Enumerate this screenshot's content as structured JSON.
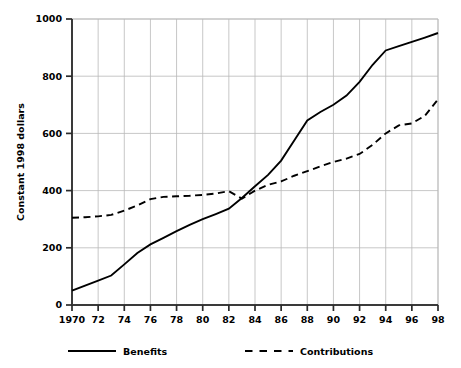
{
  "chart_data": {
    "type": "line",
    "title": "",
    "xlabel": "",
    "ylabel": "Constant 1998 dollars",
    "xlim": [
      1970,
      1998
    ],
    "ylim": [
      0,
      1000
    ],
    "grid": true,
    "legend_position": "bottom",
    "x": [
      1970,
      1971,
      1972,
      1973,
      1974,
      1975,
      1976,
      1977,
      1978,
      1979,
      1980,
      1981,
      1982,
      1983,
      1984,
      1985,
      1986,
      1987,
      1988,
      1989,
      1990,
      1991,
      1992,
      1993,
      1994,
      1995,
      1996,
      1997,
      1998
    ],
    "x_tick_labels": [
      "1970",
      "72",
      "74",
      "76",
      "78",
      "80",
      "82",
      "84",
      "86",
      "88",
      "90",
      "92",
      "94",
      "96",
      "98"
    ],
    "y_tick_labels": [
      "0",
      "200",
      "400",
      "600",
      "800",
      "1000"
    ],
    "y_ticks": [
      0,
      200,
      400,
      600,
      800,
      1000
    ],
    "series": [
      {
        "name": "Benefits",
        "style": "solid",
        "color": "#000000",
        "values": [
          50,
          68,
          85,
          103,
          142,
          182,
          212,
          235,
          258,
          280,
          300,
          318,
          337,
          374,
          415,
          455,
          505,
          575,
          645,
          675,
          700,
          732,
          780,
          840,
          890,
          905,
          920,
          935,
          951
        ]
      },
      {
        "name": "Contributions",
        "style": "dashed",
        "color": "#000000",
        "values": [
          305,
          307,
          310,
          315,
          330,
          348,
          370,
          378,
          380,
          382,
          385,
          390,
          398,
          372,
          400,
          420,
          432,
          452,
          468,
          485,
          500,
          512,
          528,
          560,
          600,
          628,
          635,
          662,
          719
        ]
      }
    ],
    "legend": [
      {
        "label": "Benefits",
        "style": "solid"
      },
      {
        "label": "Contributions",
        "style": "dashed"
      }
    ]
  }
}
